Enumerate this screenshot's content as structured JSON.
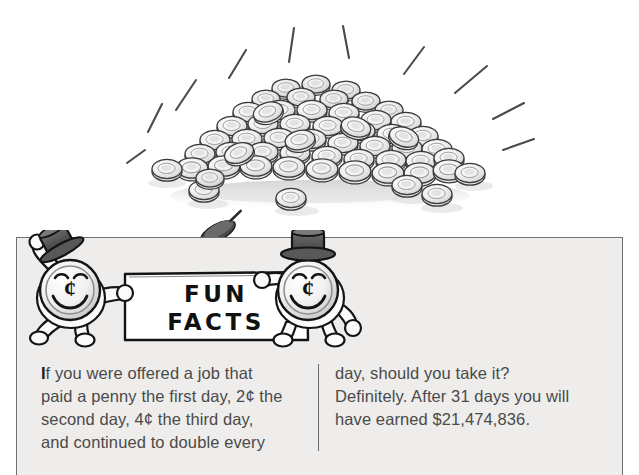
{
  "page": {
    "background_color": "#ffffff"
  },
  "illustration": {
    "name": "pile-of-pennies",
    "description": "Hand-drawn pile of pennies with radiating sparkle lines",
    "coin_count_drawn": 58,
    "sparkle_line_count": 10,
    "line_art_color": "#3a3a3a",
    "coin_fill_color": "#f4f4f4",
    "coin_shade_color": "#c9c9c9",
    "shadow_color": "#d8d8d8"
  },
  "fun_panel": {
    "background_color": "#eeedeb",
    "border_color": "#6f6f6f",
    "banner": {
      "sign_label_line_1": "FUN",
      "sign_label_line_2": "FACTS",
      "sign_fill_color": "#ffffff",
      "sign_border_color": "#1a1a1a",
      "text_color": "#111111",
      "left_mascot": {
        "name": "penny-character-left",
        "face_symbol": "¢",
        "hat": "top-hat-tilted",
        "hat_color": "#4d4d4d"
      },
      "right_mascot": {
        "name": "penny-character-right",
        "face_symbol": "¢",
        "hat": "top-hat",
        "hat_color": "#4d4d4d"
      }
    },
    "text": {
      "dropcap": "I",
      "divider_color": "#6b6b6b",
      "body_color": "#4a4a4a",
      "left_column": [
        "f you were offered a job that",
        "paid a penny the first day, 2¢ the",
        "second day, 4¢ the third day,",
        "and continued to double every"
      ],
      "right_column": [
        "day, should you take it?",
        "Definitely. After 31 days you will",
        "have earned $21,474,836."
      ]
    }
  }
}
